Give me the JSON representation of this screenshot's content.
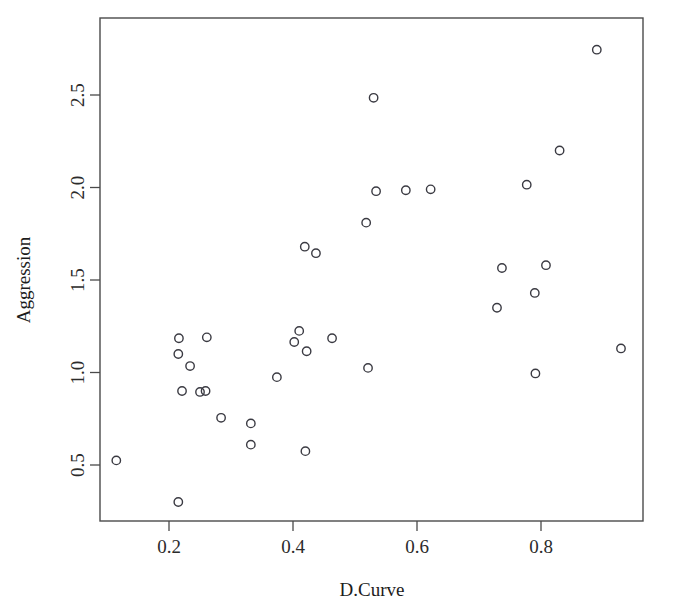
{
  "chart_data": {
    "type": "scatter",
    "title": "",
    "subtitle": "",
    "xlabel": "D.Curve",
    "ylabel": "Aggression",
    "xlim": [
      0.1,
      0.945
    ],
    "ylim": [
      0.235,
      2.855
    ],
    "grid": false,
    "legend": null,
    "xticks": [
      0.2,
      0.4,
      0.6,
      0.8
    ],
    "xtick_labels": [
      "0.2",
      "0.4",
      "0.6",
      "0.8"
    ],
    "yticks": [
      0.5,
      1.0,
      1.5,
      2.0,
      2.5
    ],
    "ytick_labels": [
      "0.5",
      "1.0",
      "1.5",
      "2.0",
      "2.5"
    ],
    "marker": {
      "shape": "open-circle",
      "radius": 4.2,
      "stroke": "#3a3a42",
      "stroke_width": 1.4,
      "fill": "none"
    },
    "annotations": [],
    "n_points": 35,
    "points": [
      {
        "x": 0.115,
        "y": 0.525
      },
      {
        "x": 0.215,
        "y": 0.3
      },
      {
        "x": 0.215,
        "y": 1.1
      },
      {
        "x": 0.216,
        "y": 1.185
      },
      {
        "x": 0.221,
        "y": 0.9
      },
      {
        "x": 0.234,
        "y": 1.035
      },
      {
        "x": 0.25,
        "y": 0.895
      },
      {
        "x": 0.259,
        "y": 0.9
      },
      {
        "x": 0.261,
        "y": 1.19
      },
      {
        "x": 0.284,
        "y": 0.755
      },
      {
        "x": 0.332,
        "y": 0.725
      },
      {
        "x": 0.332,
        "y": 0.61
      },
      {
        "x": 0.374,
        "y": 0.975
      },
      {
        "x": 0.402,
        "y": 1.165
      },
      {
        "x": 0.41,
        "y": 1.225
      },
      {
        "x": 0.419,
        "y": 1.68
      },
      {
        "x": 0.42,
        "y": 0.575
      },
      {
        "x": 0.422,
        "y": 1.115
      },
      {
        "x": 0.437,
        "y": 1.645
      },
      {
        "x": 0.463,
        "y": 1.185
      },
      {
        "x": 0.518,
        "y": 1.81
      },
      {
        "x": 0.521,
        "y": 1.025
      },
      {
        "x": 0.53,
        "y": 2.485
      },
      {
        "x": 0.534,
        "y": 1.98
      },
      {
        "x": 0.582,
        "y": 1.985
      },
      {
        "x": 0.622,
        "y": 1.99
      },
      {
        "x": 0.729,
        "y": 1.35
      },
      {
        "x": 0.737,
        "y": 1.565
      },
      {
        "x": 0.777,
        "y": 2.015
      },
      {
        "x": 0.79,
        "y": 1.43
      },
      {
        "x": 0.791,
        "y": 0.995
      },
      {
        "x": 0.808,
        "y": 1.58
      },
      {
        "x": 0.83,
        "y": 2.2
      },
      {
        "x": 0.89,
        "y": 2.745
      },
      {
        "x": 0.929,
        "y": 1.13
      }
    ]
  }
}
